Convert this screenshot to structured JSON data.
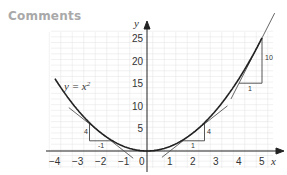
{
  "heading": "Comments",
  "chart_data": {
    "type": "line",
    "title": "",
    "xlabel": "x",
    "ylabel": "y",
    "xlim": [
      -4,
      5
    ],
    "ylim": [
      0,
      25
    ],
    "x_ticks": [
      "-4",
      "-3",
      "-2",
      "-1",
      "0",
      "1",
      "2",
      "3",
      "4",
      "5"
    ],
    "y_ticks": [
      "5",
      "10",
      "15",
      "20",
      "25"
    ],
    "grid": true,
    "series": [
      {
        "name": "y = x²",
        "x": [
          -4,
          -3.5,
          -3,
          -2.5,
          -2,
          -1.5,
          -1,
          -0.5,
          0,
          0.5,
          1,
          1.5,
          2,
          2.5,
          3,
          3.5,
          4,
          4.5,
          5
        ],
        "values": [
          16,
          12.25,
          9,
          6.25,
          4,
          2.25,
          1,
          0.25,
          0,
          0.25,
          1,
          2.25,
          4,
          6.25,
          9,
          12.25,
          16,
          20.25,
          25
        ]
      }
    ],
    "tangents": [
      {
        "at_x": -2,
        "slope": -4,
        "rise_label": "4",
        "run_label": "-1"
      },
      {
        "at_x": 2,
        "slope": 4,
        "rise_label": "4",
        "run_label": "1"
      },
      {
        "at_x": 5,
        "slope": 10,
        "rise_label": "10",
        "run_label": "1"
      }
    ],
    "annotations": [
      "y = x²"
    ]
  },
  "labels": {
    "curve": "y = x",
    "curve_exp": "2",
    "x_axis": "x",
    "y_axis": "y",
    "left_rise": "4",
    "left_run": "-1",
    "right_rise": "4",
    "right_run": "1",
    "top_rise": "10",
    "top_run": "1"
  }
}
